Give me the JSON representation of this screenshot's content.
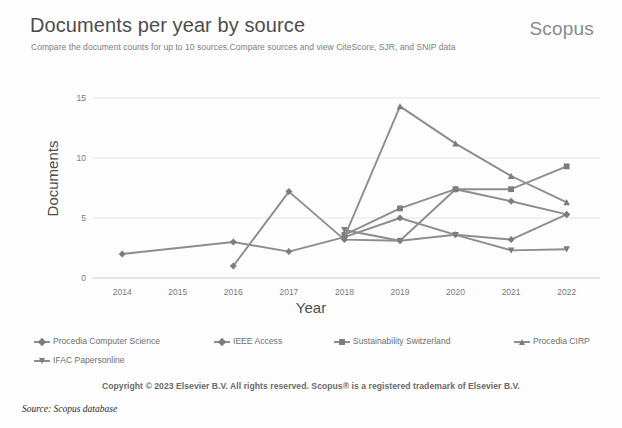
{
  "header": {
    "title": "Documents per year by source",
    "brand": "Scopus",
    "subtitle": "Compare the document counts for up to 10 sources.Compare sources and view CiteScore, SJR, and SNIP data"
  },
  "footer": {
    "copyright": "Copyright © 2023 Elsevier B.V. All rights reserved. Scopus® is a registered trademark of Elsevier B.V.",
    "source_note": "Source: Scopus database"
  },
  "colors": {
    "line": "#8d8d8d",
    "marker": "#7d7d7d",
    "grid": "#e6e6e6",
    "axis": "#d9d9d9",
    "title_text": "#4d4d4d",
    "brand_text": "#8a8a8a",
    "tick_text": "#7a7a7a"
  },
  "chart_data": {
    "type": "line",
    "title": "Documents per year by source",
    "xlabel": "Year",
    "ylabel": "Documents",
    "categories": [
      2014,
      2015,
      2016,
      2017,
      2018,
      2019,
      2020,
      2021,
      2022
    ],
    "x": [
      2014,
      2015,
      2016,
      2017,
      2018,
      2019,
      2020,
      2021,
      2022
    ],
    "xlim": [
      2013.6,
      2022.6
    ],
    "ylim": [
      0,
      16
    ],
    "yticks": [
      0,
      5,
      10,
      15
    ],
    "ytick_labels": [
      "0",
      "5",
      "10",
      "15"
    ],
    "xtick_labels": [
      "2014",
      "2015",
      "2016",
      "2017",
      "2018",
      "2019",
      "2020",
      "2021",
      "2022"
    ],
    "grid": "horizontal",
    "legend_position": "bottom",
    "series": [
      {
        "name": "Procedia Computer Science",
        "marker": "diamond",
        "color": "#8d8d8d",
        "x": [
          2014,
          2016,
          2017,
          2018,
          2019,
          2020,
          2021,
          2022
        ],
        "values": [
          2.0,
          3.0,
          2.2,
          3.4,
          5.0,
          3.6,
          3.2,
          5.3
        ]
      },
      {
        "name": "IEEE Access",
        "marker": "diamond-small",
        "color": "#8d8d8d",
        "x": [
          2016,
          2017,
          2018,
          2019,
          2020,
          2021,
          2022
        ],
        "values": [
          1.0,
          7.2,
          3.2,
          3.1,
          7.4,
          6.4,
          5.3
        ]
      },
      {
        "name": "Sustainability Switzerland",
        "marker": "square",
        "color": "#8d8d8d",
        "x": [
          2018,
          2019,
          2020,
          2021,
          2022
        ],
        "values": [
          3.6,
          5.8,
          7.4,
          7.4,
          9.3
        ]
      },
      {
        "name": "Procedia CIRP",
        "marker": "triangle-up",
        "color": "#8d8d8d",
        "x": [
          2018,
          2019,
          2020,
          2021,
          2022
        ],
        "values": [
          3.4,
          14.3,
          11.2,
          8.5,
          6.3
        ]
      },
      {
        "name": "IFAC Papersonline",
        "marker": "triangle-down",
        "color": "#8d8d8d",
        "x": [
          2018,
          2019,
          2020,
          2021,
          2022
        ],
        "values": [
          4.0,
          3.1,
          3.6,
          2.3,
          2.4
        ]
      }
    ]
  },
  "legend": {
    "rows": [
      [
        {
          "label": "Procedia Computer Science",
          "marker": "diamond"
        },
        {
          "label": "IEEE Access",
          "marker": "diamond"
        },
        {
          "label": "Sustainability Switzerland",
          "marker": "square"
        },
        {
          "label": "Procedia CIRP",
          "marker": "triangle-up"
        }
      ],
      [
        {
          "label": "IFAC Papersonline",
          "marker": "triangle-down"
        }
      ]
    ]
  }
}
